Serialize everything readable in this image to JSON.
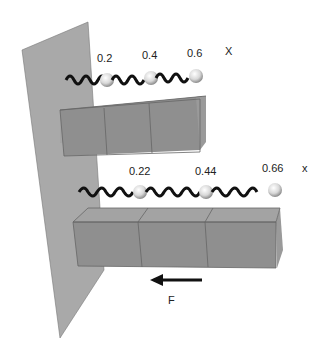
{
  "top_row": {
    "labels": [
      "0.2",
      "0.4",
      "0.6"
    ],
    "axis": "X"
  },
  "bottom_row": {
    "labels": [
      "0.22",
      "0.44",
      "0.66"
    ],
    "axis": "x"
  },
  "force": {
    "label": "F"
  },
  "colors": {
    "wall": "#a9a9a9",
    "block_front": "#8f8f8f",
    "block_top": "#a3a3a3",
    "block_side": "#9a9a9a",
    "spring": "#111111"
  }
}
